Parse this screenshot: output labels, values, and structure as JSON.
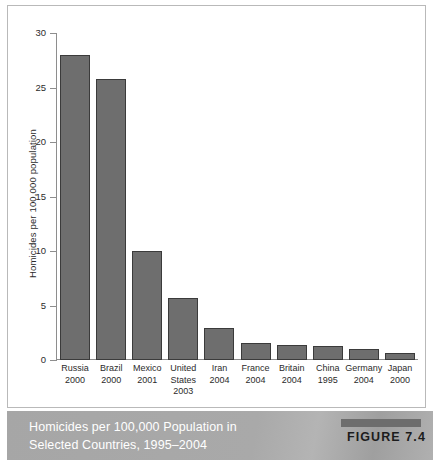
{
  "figure": {
    "badge_bar": "figure-rule",
    "badge_label": "FIGURE 7.4",
    "caption_line1": "Homicides per 100,000 Population in",
    "caption_line2": "Selected Countries, 1995–2004",
    "band_color": "#a9a9a9",
    "bar_fill": "#6e6e6e",
    "bar_stroke": "#3b3b3b"
  },
  "chart_data": {
    "type": "bar",
    "title": "Homicides per 100,000 Population in Selected Countries, 1995–2004",
    "subtitle": "",
    "xlabel": "",
    "ylabel": "Homicides per 100,000 population",
    "ylim": [
      0,
      30
    ],
    "yticks": [
      0,
      5,
      10,
      15,
      20,
      25,
      30
    ],
    "ytick_labels": [
      "0",
      "5",
      "10",
      "15",
      "20",
      "25",
      "30"
    ],
    "grid": false,
    "legend": "none",
    "categories": [
      "Russia 2000",
      "Brazil 2000",
      "Mexico 2001",
      "United States 2003",
      "Iran 2004",
      "France 2004",
      "Britain 2004",
      "China 1995",
      "Germany 2004",
      "Japan 2000"
    ],
    "category_lines": [
      [
        "Russia",
        "2000"
      ],
      [
        "Brazil",
        "2000"
      ],
      [
        "Mexico",
        "2001"
      ],
      [
        "United",
        "States",
        "2003"
      ],
      [
        "Iran",
        "2004"
      ],
      [
        "France",
        "2004"
      ],
      [
        "Britain",
        "2004"
      ],
      [
        "China",
        "1995"
      ],
      [
        "Germany",
        "2004"
      ],
      [
        "Japan",
        "2000"
      ]
    ],
    "values": [
      28.0,
      25.8,
      10.0,
      5.7,
      2.9,
      1.6,
      1.4,
      1.3,
      1.0,
      0.6
    ]
  }
}
